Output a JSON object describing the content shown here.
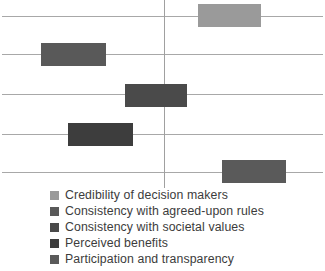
{
  "chart_data": {
    "type": "bar",
    "subtype": "floating-bar-forest-plot",
    "title": "",
    "xlabel": "",
    "ylabel": "",
    "grid": false,
    "legend_position": "bottom-left",
    "xlim": [
      -1.0,
      1.0
    ],
    "zero_reference": 0,
    "categories": [
      "Credibility of decision makers",
      "Consistency with agreed-upon rules",
      "Consistency with societal values",
      "Perceived benefits",
      "Participation and transparency"
    ],
    "series": [
      {
        "name": "Credibility of decision makers",
        "box_low": 0.21,
        "box_high": 0.6,
        "whisker_low": -1.0,
        "whisker_high": 1.0,
        "color": "#9a9a9a"
      },
      {
        "name": "Consistency with agreed-upon rules",
        "box_low": -0.76,
        "box_high": -0.36,
        "whisker_low": -1.0,
        "whisker_high": 1.0,
        "color": "#595959"
      },
      {
        "name": "Consistency with societal values",
        "box_low": -0.24,
        "box_high": 0.14,
        "whisker_low": -1.0,
        "whisker_high": 1.0,
        "color": "#4a4a4a"
      },
      {
        "name": "Perceived benefits",
        "box_low": -0.59,
        "box_high": -0.19,
        "whisker_low": -1.0,
        "whisker_high": 1.0,
        "color": "#3d3d3d"
      },
      {
        "name": "Participation and transparency",
        "box_low": 0.36,
        "box_high": 0.75,
        "whisker_low": -1.0,
        "whisker_high": 1.0,
        "color": "#5a5a5a"
      }
    ],
    "colors": {
      "whisker": "#a8a8a8",
      "zero_line": "#a0a0a0",
      "background": "#ffffff",
      "legend_text": "#3c3c3c"
    }
  },
  "legend": {
    "items": [
      {
        "label": "Credibility of decision makers",
        "color": "#9a9a9a"
      },
      {
        "label": "Consistency with agreed-upon rules",
        "color": "#595959"
      },
      {
        "label": "Consistency with societal values",
        "color": "#4a4a4a"
      },
      {
        "label": "Perceived benefits",
        "color": "#3d3d3d"
      },
      {
        "label": "Participation and transparency",
        "color": "#5a5a5a"
      }
    ]
  },
  "geometry": {
    "plot_width": 325,
    "plot_height": 188,
    "zero_x": 164,
    "whisker_left": 2,
    "whisker_right": 323,
    "rows": [
      {
        "whisker_y": 16,
        "box_x": 198,
        "box_w": 63,
        "box_y": 4,
        "box_h": 23
      },
      {
        "whisker_y": 54,
        "box_x": 41,
        "box_w": 65,
        "box_y": 43,
        "box_h": 23
      },
      {
        "whisker_y": 94,
        "box_x": 125,
        "box_w": 62,
        "box_y": 84,
        "box_h": 23
      },
      {
        "whisker_y": 134,
        "box_x": 68,
        "box_w": 65,
        "box_y": 123,
        "box_h": 23
      },
      {
        "whisker_y": 172,
        "box_x": 222,
        "box_w": 64,
        "box_y": 160,
        "box_h": 23
      }
    ]
  }
}
